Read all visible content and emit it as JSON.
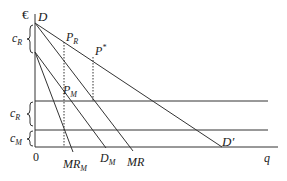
{
  "labels": {
    "currency": "€",
    "D": "D",
    "PR": "P",
    "PR_sub": "R",
    "Pstar": "P",
    "Pstar_sup": "*",
    "PM": "P",
    "PM_sub": "M",
    "cR_top": "c",
    "cR_top_sub": "R",
    "cR_low": "c",
    "cR_low_sub": "R",
    "cM": "c",
    "cM_sub": "M",
    "origin": "0",
    "MRM": "MR",
    "MRM_sub": "M",
    "DM": "D",
    "DM_sub": "M",
    "MR": "MR",
    "Dprime": "D′",
    "q": "q"
  },
  "colors": {
    "line": "#333333",
    "text": "#222222"
  }
}
